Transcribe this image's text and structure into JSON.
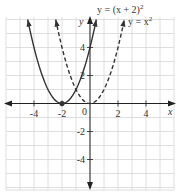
{
  "chart_data": {
    "type": "line",
    "title": "",
    "xlabel": "x",
    "ylabel": "y",
    "xlim": [
      -6,
      6
    ],
    "ylim": [
      -6,
      6
    ],
    "grid": true,
    "x_ticks": [
      -4,
      -2,
      2,
      4
    ],
    "x_tick_labels": [
      "-4",
      "-2",
      "2",
      "4"
    ],
    "y_ticks": [
      -4,
      -2,
      2,
      4
    ],
    "y_tick_labels": [
      "-4",
      "-2",
      "2",
      "4"
    ],
    "origin_label": "0",
    "series": [
      {
        "name": "y = (x+2)^2",
        "label": "y = (x + 2)",
        "label_superscript": "2",
        "style": "solid",
        "expression": "(x+2)^2",
        "x": [
          -4.45,
          -4,
          -3,
          -2,
          -1,
          0,
          0.45
        ],
        "values": [
          6,
          4,
          1,
          0,
          1,
          4,
          6
        ],
        "vertex": [
          -2,
          0
        ],
        "vertex_marked": true
      },
      {
        "name": "y = x^2",
        "label": "y = x",
        "label_superscript": "2",
        "style": "dashed",
        "expression": "x^2",
        "x": [
          -2.45,
          -2,
          -1,
          0,
          1,
          2,
          2.45
        ],
        "values": [
          6,
          4,
          1,
          0,
          1,
          4,
          6
        ],
        "vertex": [
          0,
          0
        ],
        "vertex_marked": false
      }
    ],
    "colors": {
      "curve": "#333333",
      "grid": "#d6d6d6",
      "axis": "#222222"
    }
  }
}
